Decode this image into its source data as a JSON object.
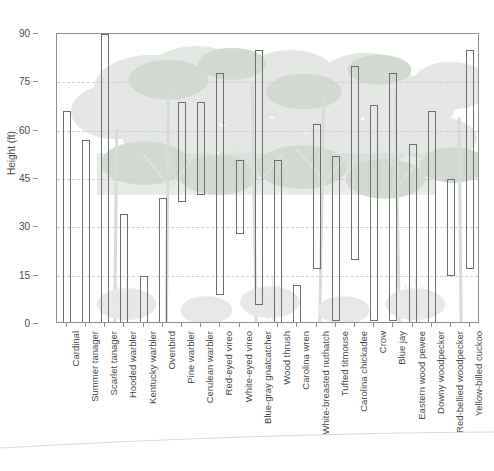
{
  "chart_data": {
    "type": "bar",
    "subtype": "floating-range-bars",
    "title": "",
    "subtitle": "",
    "xlabel": "",
    "ylabel": "Height (ft)",
    "ylim": [
      0,
      90
    ],
    "yticks": [
      0,
      15,
      30,
      45,
      60,
      75,
      90
    ],
    "ytick_labels": [
      "0",
      "15",
      "30",
      "45",
      "60",
      "75",
      "90"
    ],
    "grid": true,
    "grid_axis": "y",
    "grid_style": "dashed",
    "legend": "none",
    "bar_fill": "none",
    "bar_edge_color": "#6e6e6e",
    "background_image": "forest-silhouette-watermark",
    "categories": [
      "Cardinal",
      "Summer tanager",
      "Scarlet tanager",
      "Hooded warbler",
      "Kentucky warbler",
      "Ovenbird",
      "Pine warbler",
      "Cerulean warbler",
      "Red-eyed vireo",
      "White-eyed vireo",
      "Blue-gray gnatcatcher",
      "Wood thrush",
      "Carolina wren",
      "White-breasted nuthatch",
      "Tufted titmouse",
      "Carolina chickadee",
      "Crow",
      "Blue jay",
      "Eastern wood pewee",
      "Downy woodpecker",
      "Red-bellied woodpecker",
      "Yellow-billed cuckoo"
    ],
    "series": [
      {
        "name": "Foraging height range (ft)",
        "low": [
          0,
          0,
          0,
          0,
          0,
          0,
          38,
          40,
          9,
          28,
          6,
          0,
          0,
          17,
          1,
          20,
          1,
          1,
          0,
          0,
          15,
          17
        ],
        "high": [
          66,
          57,
          90,
          34,
          15,
          39,
          69,
          69,
          78,
          51,
          85,
          51,
          12,
          62,
          52,
          80,
          68,
          78,
          56,
          66,
          45,
          85
        ]
      }
    ],
    "bars": [
      {
        "label": "Cardinal",
        "low": 0,
        "high": 66
      },
      {
        "label": "Summer tanager",
        "low": 0,
        "high": 57
      },
      {
        "label": "Scarlet tanager",
        "low": 0,
        "high": 90
      },
      {
        "label": "Hooded warbler",
        "low": 0,
        "high": 34
      },
      {
        "label": "Kentucky warbler",
        "low": 0,
        "high": 15
      },
      {
        "label": "Ovenbird",
        "low": 0,
        "high": 39
      },
      {
        "label": "Pine warbler",
        "low": 38,
        "high": 69
      },
      {
        "label": "Cerulean warbler",
        "low": 40,
        "high": 69
      },
      {
        "label": "Red-eyed vireo",
        "low": 9,
        "high": 78
      },
      {
        "label": "White-eyed vireo",
        "low": 28,
        "high": 51
      },
      {
        "label": "Blue-gray gnatcatcher",
        "low": 6,
        "high": 85
      },
      {
        "label": "Wood thrush",
        "low": 0,
        "high": 51
      },
      {
        "label": "Carolina wren",
        "low": 0,
        "high": 12
      },
      {
        "label": "White-breasted nuthatch",
        "low": 17,
        "high": 62
      },
      {
        "label": "Tufted titmouse",
        "low": 1,
        "high": 52
      },
      {
        "label": "Carolina chickadee",
        "low": 20,
        "high": 80
      },
      {
        "label": "Crow",
        "low": 1,
        "high": 68
      },
      {
        "label": "Blue jay",
        "low": 1,
        "high": 78
      },
      {
        "label": "Eastern wood pewee",
        "low": 0,
        "high": 56
      },
      {
        "label": "Downy woodpecker",
        "low": 0,
        "high": 66
      },
      {
        "label": "Red-bellied woodpecker",
        "low": 15,
        "high": 45
      },
      {
        "label": "Yellow-billed cuckoo",
        "low": 17,
        "high": 85
      }
    ]
  },
  "axes": {
    "y_title": "Height (ft)"
  }
}
